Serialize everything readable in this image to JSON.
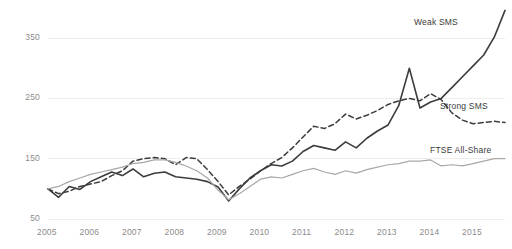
{
  "chart_data": {
    "type": "line",
    "title": "",
    "subtitle": "",
    "xlabel": "",
    "ylabel": "",
    "grid": true,
    "legend_position": "right-inline",
    "xlim": [
      2005.0,
      2015.75
    ],
    "ylim": [
      50,
      400
    ],
    "yticks": [
      50,
      150,
      250,
      350
    ],
    "ytick_labels": [
      "50",
      "150",
      "250",
      "350"
    ],
    "xticks": [
      2005,
      2006,
      2007,
      2008,
      2009,
      2010,
      2011,
      2012,
      2013,
      2014,
      2015
    ],
    "xtick_labels": [
      "2005",
      "2006",
      "2007",
      "2008",
      "2009",
      "2010",
      "2011",
      "2012",
      "2013",
      "2014",
      "2015"
    ],
    "x": [
      2005.0,
      2005.25,
      2005.5,
      2005.75,
      2006.0,
      2006.25,
      2006.5,
      2006.75,
      2007.0,
      2007.25,
      2007.5,
      2007.75,
      2008.0,
      2008.25,
      2008.5,
      2008.75,
      2009.0,
      2009.25,
      2009.5,
      2009.75,
      2010.0,
      2010.25,
      2010.5,
      2010.75,
      2011.0,
      2011.25,
      2011.5,
      2011.75,
      2012.0,
      2012.25,
      2012.5,
      2012.75,
      2013.0,
      2013.25,
      2013.5,
      2013.75,
      2014.0,
      2014.25,
      2014.5,
      2014.75,
      2015.0,
      2015.25,
      2015.5,
      2015.75
    ],
    "series": [
      {
        "name": "Weak SMS",
        "style": "solid",
        "color": "#3c3c3c",
        "width": 1.6,
        "values": [
          100,
          86,
          104,
          99,
          112,
          120,
          128,
          122,
          133,
          120,
          126,
          128,
          120,
          118,
          116,
          112,
          103,
          80,
          100,
          118,
          130,
          140,
          138,
          146,
          162,
          172,
          168,
          164,
          178,
          168,
          184,
          196,
          206,
          238,
          300,
          234,
          244,
          250,
          268,
          286,
          304,
          322,
          352,
          396
        ]
      },
      {
        "name": "Strong SMS",
        "style": "dashed",
        "color": "#3c3c3c",
        "width": 1.5,
        "values": [
          100,
          92,
          96,
          104,
          108,
          112,
          122,
          130,
          146,
          150,
          152,
          150,
          140,
          152,
          150,
          132,
          112,
          90,
          104,
          116,
          130,
          142,
          152,
          168,
          186,
          204,
          200,
          208,
          224,
          216,
          222,
          230,
          240,
          246,
          250,
          246,
          258,
          248,
          226,
          214,
          208,
          210,
          212,
          210
        ]
      },
      {
        "name": "FTSE All-Share",
        "style": "solid",
        "color": "#a8a8a8",
        "width": 1.2,
        "values": [
          100,
          104,
          112,
          118,
          124,
          128,
          132,
          136,
          142,
          144,
          148,
          148,
          144,
          138,
          130,
          118,
          98,
          82,
          92,
          104,
          116,
          120,
          118,
          124,
          130,
          134,
          128,
          124,
          130,
          126,
          132,
          136,
          140,
          142,
          146,
          146,
          148,
          138,
          140,
          138,
          142,
          146,
          150,
          150
        ]
      }
    ],
    "annotations": [
      {
        "text": "Weak SMS",
        "x_px": 414,
        "y_px": 17
      },
      {
        "text": "Strong SMS",
        "x_px": 440,
        "y_px": 101
      },
      {
        "text": "FTSE All-Share",
        "x_px": 430,
        "y_px": 145
      }
    ],
    "colors": {
      "gridline": "#eeeeee",
      "tick_text": "#8c8c8c",
      "label_text": "#3a3a3a",
      "background": "#ffffff"
    }
  }
}
